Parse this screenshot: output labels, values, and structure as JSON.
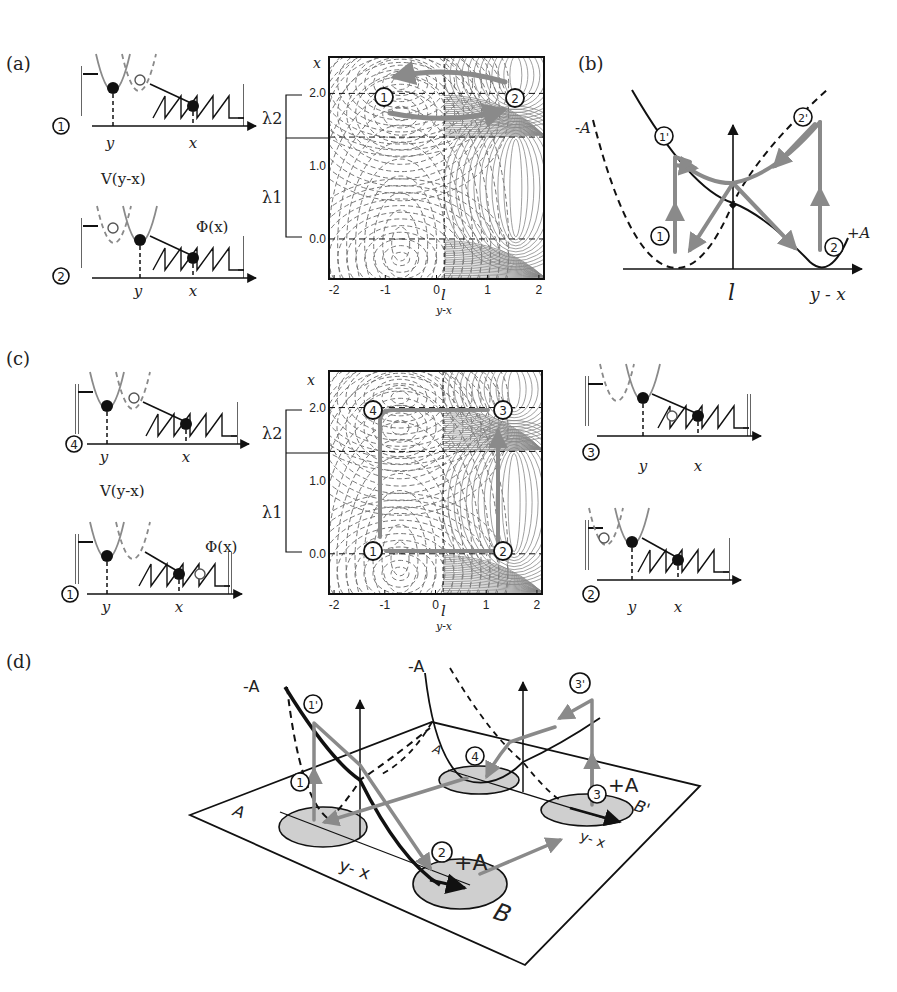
{
  "figure": {
    "panels": {
      "a": {
        "label": "(a)",
        "states": [
          {
            "marker": "1",
            "x_label": "x",
            "y_label": "y"
          },
          {
            "marker": "2",
            "x_label": "x",
            "y_label": "y",
            "potential_label": "V(y-x)",
            "spring_label": "Φ(x)"
          }
        ],
        "bracket": {
          "upper": "λ2",
          "lower": "λ1"
        },
        "contour": {
          "y_axis_label": "x",
          "x_axis_label": "y-x",
          "l_label": "l",
          "x_ticks": [
            "-2",
            "-1",
            "0",
            "1",
            "2"
          ],
          "y_ticks": [
            "2.0",
            "1.0",
            "0.0"
          ],
          "state_markers": [
            "1",
            "2"
          ]
        }
      },
      "b": {
        "label": "(b)",
        "curve_labels": {
          "minus": "-A",
          "plus": "+A"
        },
        "markers": [
          "1",
          "1'",
          "2",
          "2'"
        ],
        "axis_label": "y - x",
        "l_label": "l"
      },
      "c": {
        "label": "(c)",
        "states_left": [
          {
            "marker": "4",
            "x_label": "x",
            "y_label": "y"
          },
          {
            "marker": "1",
            "x_label": "x",
            "y_label": "y",
            "potential_label": "V(y-x)",
            "spring_label": "Φ(x)"
          }
        ],
        "states_right": [
          {
            "marker": "3",
            "x_label": "x",
            "y_label": "y"
          },
          {
            "marker": "2",
            "x_label": "x",
            "y_label": "y"
          }
        ],
        "bracket": {
          "upper": "λ2",
          "lower": "λ1"
        },
        "contour": {
          "y_axis_label": "x",
          "x_axis_label": "y-x",
          "l_label": "l",
          "x_ticks": [
            "-2",
            "-1",
            "0",
            "1",
            "2"
          ],
          "y_ticks": [
            "2.0",
            "1.0",
            "0.0"
          ],
          "state_markers": [
            "4",
            "3",
            "1",
            "2"
          ]
        }
      },
      "d": {
        "label": "(d)",
        "curve_labels": {
          "minus_left": "-A",
          "minus_right": "-A",
          "plus_front": "+A",
          "plus_back": "+A"
        },
        "markers": [
          "1",
          "1'",
          "2",
          "3",
          "3'",
          "4"
        ],
        "plane_labels": {
          "a": "A",
          "a_back": "A",
          "b": "B",
          "b_back": "B'"
        },
        "axis_labels": {
          "front": "y- x",
          "back": "y- x"
        }
      }
    }
  },
  "colors": {
    "ink": "#111111",
    "gray_path": "#8a8a8a",
    "contour_gray": "#888888",
    "ellipse_fill": "#cfcfcf"
  }
}
